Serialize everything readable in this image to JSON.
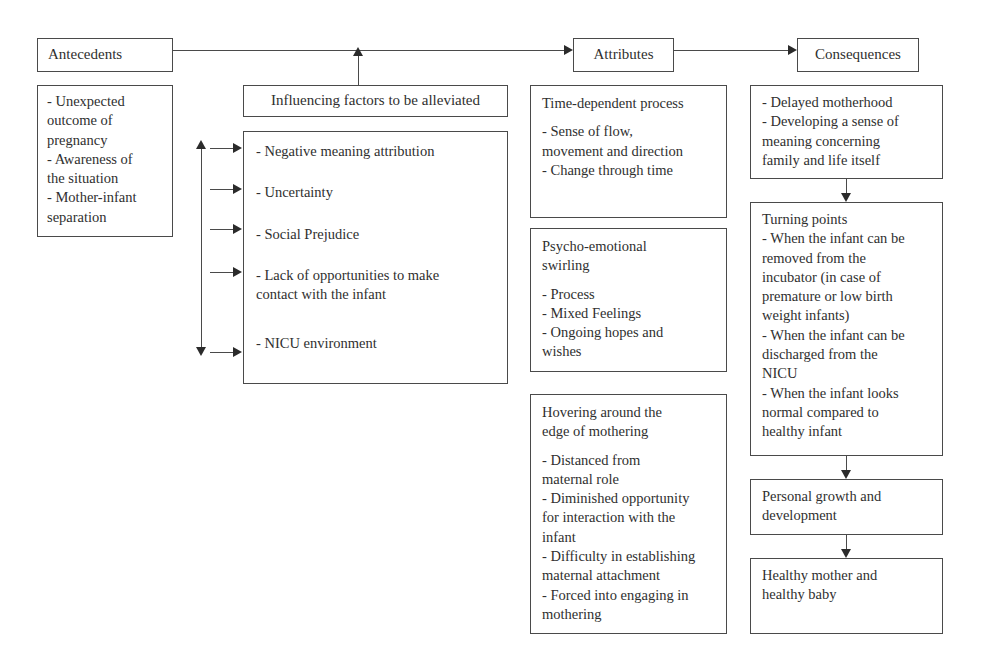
{
  "diagram": {
    "columns": {
      "antecedents": {
        "header": "Antecedents",
        "detail": "- Unexpected\noutcome of\npregnancy\n- Awareness of\nthe situation\n- Mother-infant\nseparation"
      },
      "influencing": {
        "header": "Influencing factors to be alleviated",
        "items": [
          "- Negative meaning attribution",
          "- Uncertainty",
          "- Social Prejudice",
          "- Lack of opportunities to make\ncontact with the infant",
          "- NICU environment"
        ]
      },
      "attributes": {
        "header": "Attributes",
        "groups": [
          {
            "title": "Time-dependent process",
            "body": "- Sense of flow,\nmovement and direction\n- Change through time"
          },
          {
            "title": "Psycho-emotional\nswirling",
            "body": "- Process\n- Mixed Feelings\n- Ongoing hopes and\nwishes"
          },
          {
            "title": "Hovering around the\nedge of mothering",
            "body": "- Distanced from\nmaternal role\n- Diminished opportunity\nfor interaction with the\ninfant\n- Difficulty in establishing\nmaternal attachment\n- Forced into engaging in\nmothering"
          }
        ]
      },
      "consequences": {
        "header": "Consequences",
        "stages": [
          {
            "title": "",
            "body": "- Delayed motherhood\n- Developing a sense of\nmeaning concerning\nfamily and life itself"
          },
          {
            "title": "Turning points",
            "body": "- When the infant can be\nremoved from the\nincubator (in case of\npremature or low birth\nweight infants)\n- When the infant can be\ndischarged from the\nNICU\n- When the infant looks\nnormal compared to\nhealthy infant"
          },
          {
            "title": "",
            "body": "Personal growth and\ndevelopment"
          },
          {
            "title": "",
            "body": "Healthy mother and\nhealthy baby"
          }
        ]
      }
    },
    "colors": {
      "border": "#4a4a4a",
      "text": "#2f2f2f",
      "arrow": "#2b2b2b",
      "background": "#ffffff"
    }
  }
}
